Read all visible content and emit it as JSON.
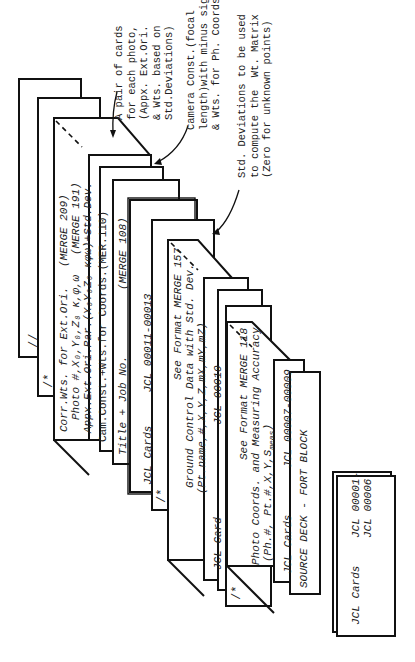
{
  "figure": {
    "type": "card-deck-diagram",
    "orientation": "rotated-90-ccw",
    "cards": [
      {
        "id": "slash-slash",
        "label": "//"
      },
      {
        "id": "slash-star-1",
        "label": "/*"
      },
      {
        "id": "corr-wts",
        "lines": [
          {
            "text": "Corr.Wts. for Ext.Ori.",
            "ref": "(MERGE 209)"
          },
          {
            "text": "Photo #,X₀,Y₀,Z₀ κ,φ,ω",
            "ref": "(MERGE 191)"
          },
          {
            "text": "Appx.Ext.Ori.Par.(X₀Y₀Z₀ κφω)+Std.Dev.",
            "ref": ""
          }
        ]
      },
      {
        "id": "cam-const",
        "label": "Cam.Const.+Wts.for Coords.(MER.110)"
      },
      {
        "id": "title-job",
        "label": "Title + Job No.",
        "ref": "(MERGE 108)"
      },
      {
        "id": "jcl-11-13",
        "label": "JCL Cards",
        "ref": "JCL 00011-00013"
      },
      {
        "id": "slash-star-2",
        "label": "/*"
      },
      {
        "id": "ground-control",
        "lines": [
          {
            "text": "See Format MERGE 157"
          },
          {
            "text": "Ground Control Data with Std. Dev."
          },
          {
            "text": "(Pt.name,#,X,Y,Z,mX,mY,mZ)"
          }
        ]
      },
      {
        "id": "jcl-10",
        "label": "JCL Card",
        "ref": "JCL 00010"
      },
      {
        "id": "slash-star-3",
        "label": "/*"
      },
      {
        "id": "photo-coords",
        "lines": [
          {
            "text": "See Format MERGE 118"
          },
          {
            "text": "Photo Coords. and Measuring Accuracy"
          },
          {
            "text": "(Ph.#, Pt.#,X,Y,S"
          },
          {
            "text": "meas",
            "sub": true
          },
          {
            "text": ")"
          }
        ]
      },
      {
        "id": "jcl-7-9",
        "label": "JCL Cards",
        "ref": "JCL 00007-00009"
      },
      {
        "id": "source-deck",
        "label": "SOURCE DECK - FORT BLOCK"
      },
      {
        "id": "jcl-1-6",
        "label": "JCL Cards",
        "ref1": "JCL 00001-",
        "ref2": "JCL 00006"
      }
    ],
    "annotations": [
      {
        "id": "pair-of-cards",
        "text": "A pair of cards\nfor each photo,\n(Appx. Ext.Ori.\n& Wts. based on\nStd.Deviations)"
      },
      {
        "id": "camera-const",
        "text": "Camera Const.(focal\nlength)with minus sign\n& Wts. for Ph. Coords."
      },
      {
        "id": "std-deviations",
        "text": "Std. Deviations to be used\nto compute the  Wt. Matrix\n(Zero for unknown points)"
      }
    ]
  }
}
